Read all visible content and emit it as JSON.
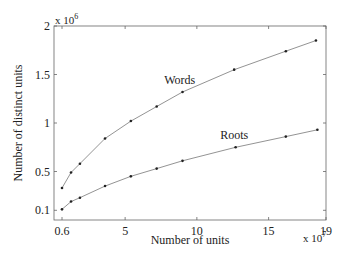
{
  "chart_data": {
    "type": "line",
    "title": "",
    "xlabel": "Number of units",
    "ylabel": "Number of distinct units",
    "x_multiplier": "x 10",
    "x_multiplier_exp": "7",
    "y_multiplier": "x 10",
    "y_multiplier_exp": "6",
    "xlim": [
      0,
      19
    ],
    "ylim": [
      0,
      2
    ],
    "x_ticks": [
      0.6,
      5,
      10,
      15,
      19
    ],
    "x_tick_labels": [
      "0.6",
      "5",
      "10",
      "15",
      "19"
    ],
    "y_ticks": [
      0.1,
      0.5,
      1,
      1.5,
      2
    ],
    "y_tick_labels": [
      "0.1",
      "0.5",
      "1",
      "1.5",
      "2"
    ],
    "grid": false,
    "legend": "inline labels",
    "series": [
      {
        "name": "Words",
        "label_pos": [
          8.8,
          1.4
        ],
        "x": [
          0.6,
          1.23,
          1.85,
          3.6,
          5.4,
          7.2,
          9.0,
          12.6,
          16.2,
          18.3
        ],
        "values": [
          0.33,
          0.49,
          0.58,
          0.84,
          1.02,
          1.17,
          1.32,
          1.55,
          1.74,
          1.85
        ]
      },
      {
        "name": "Roots",
        "label_pos": [
          12.6,
          0.83
        ],
        "x": [
          0.6,
          1.23,
          1.85,
          3.6,
          5.4,
          7.2,
          9.0,
          12.7,
          16.2,
          18.4
        ],
        "values": [
          0.11,
          0.19,
          0.23,
          0.35,
          0.45,
          0.53,
          0.61,
          0.75,
          0.86,
          0.93
        ]
      }
    ]
  }
}
